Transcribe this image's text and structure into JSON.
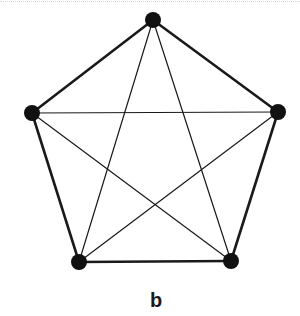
{
  "figure": {
    "label": "b",
    "graph_type": "complete graph K5",
    "colors": {
      "node": "#111111",
      "edge": "#1a1a1a",
      "background": "#ffffff"
    },
    "node_radius": 8,
    "outer_edge_width": 2.6,
    "inner_edge_width": 1.2,
    "nodes": [
      {
        "id": "top",
        "x": 153,
        "y": 20
      },
      {
        "id": "right",
        "x": 278,
        "y": 112
      },
      {
        "id": "bottom-right",
        "x": 231,
        "y": 261
      },
      {
        "id": "bottom-left",
        "x": 79,
        "y": 262
      },
      {
        "id": "left",
        "x": 32,
        "y": 113
      }
    ],
    "outer_edges": [
      [
        "top",
        "right"
      ],
      [
        "right",
        "bottom-right"
      ],
      [
        "bottom-right",
        "bottom-left"
      ],
      [
        "bottom-left",
        "left"
      ],
      [
        "left",
        "top"
      ]
    ],
    "inner_edges": [
      [
        "top",
        "bottom-right"
      ],
      [
        "top",
        "bottom-left"
      ],
      [
        "left",
        "right"
      ],
      [
        "left",
        "bottom-right"
      ],
      [
        "right",
        "bottom-left"
      ]
    ]
  }
}
